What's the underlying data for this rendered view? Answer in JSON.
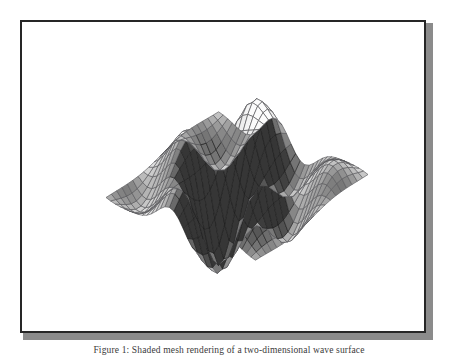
{
  "figure": {
    "frame_color": "#262626",
    "background_color": "#ffffff",
    "caption": "Figure 1: Shaded mesh rendering of a two-dimensional wave surface"
  },
  "chart_data": {
    "type": "surface",
    "title": "",
    "subtitle": "",
    "xlabel": "",
    "ylabel": "",
    "zlabel": "",
    "grid": false,
    "legend": null,
    "axes_visible": false,
    "tick_labels": [],
    "annotations": [],
    "render": {
      "style": "wireframe-mesh-shaded",
      "colormap": "gray",
      "mesh_line_color": "#4a4a4a",
      "face_light_color": "#fbfbfb",
      "face_dark_color": "#3c3c3c",
      "nx": 34,
      "ny": 22,
      "projection": "orthographic",
      "azimuth_deg": -37,
      "elevation_deg": 34
    },
    "xlim": [
      -3,
      3
    ],
    "ylim": [
      -3,
      3
    ],
    "zlim": [
      -1,
      1
    ],
    "surface_expression": "z = sin(2.1x)*cos(1.4y)*exp(-0.10*(x*x+y*y)) + 0.45*sin(3.2x + 0.8y)*exp(-0.16*(x*x+y*y))",
    "x": [
      -3,
      -2.8182,
      -2.6364,
      -2.4545,
      -2.2727,
      -2.0909,
      -1.9091,
      -1.7273,
      -1.5455,
      -1.3636,
      -1.1818,
      -1,
      -0.8182,
      -0.6364,
      -0.4545,
      -0.2727,
      -0.0909,
      0.0909,
      0.2727,
      0.4545,
      0.6364,
      0.8182,
      1,
      1.1818,
      1.3636,
      1.5455,
      1.7273,
      1.9091,
      2.0909,
      2.2727,
      2.4545,
      2.6364,
      2.8182,
      3
    ],
    "y": [
      -3,
      -2.7143,
      -2.4286,
      -2.1429,
      -1.8571,
      -1.5714,
      -1.2857,
      -1,
      -0.7143,
      -0.4286,
      -0.1429,
      0.1429,
      0.4286,
      0.7143,
      1,
      1.2857,
      1.5714,
      1.8571,
      2.1429,
      2.4286,
      2.7143,
      3
    ],
    "z_min": -0.92,
    "z_max": 0.98,
    "peaks": [
      {
        "x": -0.27,
        "y": -0.43,
        "z": 0.98,
        "note": "tall light crest, upper-left of ridge"
      },
      {
        "x": 0.64,
        "y": 0.14,
        "z": 0.91,
        "note": "broad bright dome, center-top"
      },
      {
        "x": 2.27,
        "y": -0.71,
        "z": 0.62,
        "note": "narrow right-hand spike"
      },
      {
        "x": -2.45,
        "y": 0.43,
        "z": 0.55,
        "note": "dark shaded left fold"
      }
    ],
    "valleys": [
      {
        "x": -1.18,
        "y": 1.29,
        "z": -0.88,
        "note": "deep trough under left fold"
      },
      {
        "x": 0.27,
        "y": 1.86,
        "z": -0.92,
        "note": "front-center trough"
      },
      {
        "x": 1.55,
        "y": 0.71,
        "z": -0.64,
        "note": "saddle dip toward right"
      }
    ]
  }
}
